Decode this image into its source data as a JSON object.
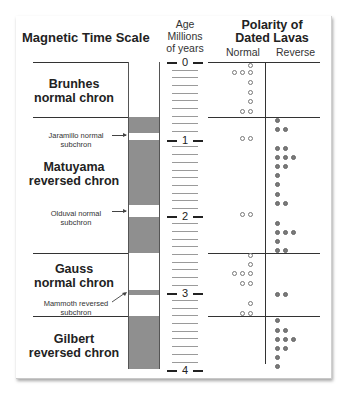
{
  "header": {
    "title": "Magnetic Time Scale",
    "age_label": [
      "Age",
      "Millions",
      "of years"
    ],
    "polarity_title": [
      "Polarity of",
      "Dated Lavas"
    ],
    "normal_label": "Normal",
    "reverse_label": "Reverse"
  },
  "scale": {
    "major_ticks": [
      "0",
      "1",
      "2",
      "3",
      "4"
    ],
    "units": "Millions of years"
  },
  "chrons": [
    {
      "name": "Brunhes",
      "type": "normal chron",
      "label": "Brunhes normal chron"
    },
    {
      "name": "Matuyama",
      "type": "reversed chron",
      "label": "Matuyama reversed chron"
    },
    {
      "name": "Gauss",
      "type": "normal chron",
      "label": "Gauss normal chron"
    },
    {
      "name": "Gilbert",
      "type": "reversed chron",
      "label": "Gilbert reversed chron"
    }
  ],
  "subchrons": [
    {
      "line1": "Jaramillo normal",
      "line2": "subchron"
    },
    {
      "line1": "Olduvai normal",
      "line2": "subchron"
    },
    {
      "line1": "Mammoth reversed",
      "line2": "subchron"
    }
  ],
  "colors": {
    "normal": "#ffffff",
    "reversed": "#8f8f8f",
    "text": "#222222"
  },
  "chart_data": {
    "type": "scatter",
    "ylabel": "Age (Millions of years)",
    "ylim": [
      0,
      4
    ],
    "polarity_intervals": [
      {
        "from": 0.0,
        "to": 0.72,
        "polarity": "normal",
        "name": "Brunhes normal chron"
      },
      {
        "from": 0.72,
        "to": 0.92,
        "polarity": "reversed",
        "name": "Matuyama reversed chron"
      },
      {
        "from": 0.92,
        "to": 1.0,
        "polarity": "normal",
        "name": "Jaramillo normal subchron"
      },
      {
        "from": 1.0,
        "to": 1.85,
        "polarity": "reversed",
        "name": "Matuyama reversed chron"
      },
      {
        "from": 1.85,
        "to": 2.01,
        "polarity": "normal",
        "name": "Olduvai normal subchron"
      },
      {
        "from": 2.01,
        "to": 2.48,
        "polarity": "reversed",
        "name": "Matuyama reversed chron"
      },
      {
        "from": 2.48,
        "to": 2.96,
        "polarity": "normal",
        "name": "Gauss normal chron"
      },
      {
        "from": 2.96,
        "to": 3.04,
        "polarity": "reversed",
        "name": "Mammoth reversed subchron"
      },
      {
        "from": 3.04,
        "to": 3.3,
        "polarity": "normal",
        "name": "Gauss normal chron"
      },
      {
        "from": 3.3,
        "to": 4.0,
        "polarity": "reversed",
        "name": "Gilbert reversed chron"
      }
    ],
    "series": [
      {
        "name": "Normal",
        "rows": [
          {
            "age": 0.05,
            "count": 1
          },
          {
            "age": 0.14,
            "count": 3
          },
          {
            "age": 0.27,
            "count": 1
          },
          {
            "age": 0.4,
            "count": 1
          },
          {
            "age": 0.52,
            "count": 1
          },
          {
            "age": 0.64,
            "count": 2
          },
          {
            "age": 1.0,
            "count": 2
          },
          {
            "age": 1.98,
            "count": 2
          },
          {
            "age": 2.52,
            "count": 1
          },
          {
            "age": 2.64,
            "count": 1
          },
          {
            "age": 2.76,
            "count": 3
          },
          {
            "age": 2.88,
            "count": 2
          },
          {
            "age": 3.15,
            "count": 1
          },
          {
            "age": 3.27,
            "count": 2
          }
        ]
      },
      {
        "name": "Reverse",
        "rows": [
          {
            "age": 0.76,
            "count": 1
          },
          {
            "age": 0.88,
            "count": 2
          },
          {
            "age": 1.12,
            "count": 2
          },
          {
            "age": 1.24,
            "count": 3
          },
          {
            "age": 1.36,
            "count": 2
          },
          {
            "age": 1.48,
            "count": 1
          },
          {
            "age": 1.6,
            "count": 1
          },
          {
            "age": 1.72,
            "count": 1
          },
          {
            "age": 1.84,
            "count": 2
          },
          {
            "age": 2.1,
            "count": 1
          },
          {
            "age": 2.22,
            "count": 3
          },
          {
            "age": 2.34,
            "count": 1
          },
          {
            "age": 2.46,
            "count": 2
          },
          {
            "age": 3.03,
            "count": 2
          },
          {
            "age": 3.37,
            "count": 1
          },
          {
            "age": 3.49,
            "count": 2
          },
          {
            "age": 3.61,
            "count": 3
          },
          {
            "age": 3.73,
            "count": 2
          },
          {
            "age": 3.85,
            "count": 1
          },
          {
            "age": 3.97,
            "count": 1
          }
        ]
      }
    ]
  }
}
